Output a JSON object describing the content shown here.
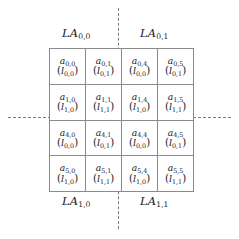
{
  "figure": {
    "name": "logical-array-partition-diagram",
    "partition_lines": {
      "vertical": "dashed",
      "horizontal": "dashed",
      "color": "#7a7a7a"
    },
    "grid": {
      "rows": 4,
      "cols": 4,
      "border_color": "#8a8a8a",
      "background": "#ffffff"
    }
  },
  "quadrant_labels": {
    "top_left": {
      "base": "LA",
      "sub": "0,0"
    },
    "top_right": {
      "base": "LA",
      "sub": "0,1"
    },
    "bottom_left": {
      "base": "LA",
      "sub": "1,0"
    },
    "bottom_right": {
      "base": "LA",
      "sub": "1,1"
    }
  },
  "cells": [
    [
      {
        "global": {
          "base": "a",
          "sub": "0,0"
        },
        "local": {
          "base": "l",
          "sub": "0,0"
        }
      },
      {
        "global": {
          "base": "a",
          "sub": "0,1"
        },
        "local": {
          "base": "l",
          "sub": "0,1"
        }
      },
      {
        "global": {
          "base": "a",
          "sub": "0,4"
        },
        "local": {
          "base": "l",
          "sub": "0,0"
        }
      },
      {
        "global": {
          "base": "a",
          "sub": "0,5"
        },
        "local": {
          "base": "l",
          "sub": "0,1"
        }
      }
    ],
    [
      {
        "global": {
          "base": "a",
          "sub": "1,0"
        },
        "local": {
          "base": "l",
          "sub": "1,0"
        }
      },
      {
        "global": {
          "base": "a",
          "sub": "1,1"
        },
        "local": {
          "base": "l",
          "sub": "1,1"
        }
      },
      {
        "global": {
          "base": "a",
          "sub": "1,4"
        },
        "local": {
          "base": "l",
          "sub": "1,0"
        }
      },
      {
        "global": {
          "base": "a",
          "sub": "1,5"
        },
        "local": {
          "base": "l",
          "sub": "1,1"
        }
      }
    ],
    [
      {
        "global": {
          "base": "a",
          "sub": "4,0"
        },
        "local": {
          "base": "l",
          "sub": "0,0"
        }
      },
      {
        "global": {
          "base": "a",
          "sub": "4,1"
        },
        "local": {
          "base": "l",
          "sub": "0,1"
        }
      },
      {
        "global": {
          "base": "a",
          "sub": "4,4"
        },
        "local": {
          "base": "l",
          "sub": "0,0"
        }
      },
      {
        "global": {
          "base": "a",
          "sub": "4,5"
        },
        "local": {
          "base": "l",
          "sub": "0,1"
        }
      }
    ],
    [
      {
        "global": {
          "base": "a",
          "sub": "5,0"
        },
        "local": {
          "base": "l",
          "sub": "1,0"
        }
      },
      {
        "global": {
          "base": "a",
          "sub": "5,1"
        },
        "local": {
          "base": "l",
          "sub": "1,1"
        }
      },
      {
        "global": {
          "base": "a",
          "sub": "5,4"
        },
        "local": {
          "base": "l",
          "sub": "1,0"
        }
      },
      {
        "global": {
          "base": "a",
          "sub": "5,5"
        },
        "local": {
          "base": "l",
          "sub": "1,1"
        }
      }
    ]
  ],
  "paren": {
    "open": "(",
    "close": ")"
  }
}
